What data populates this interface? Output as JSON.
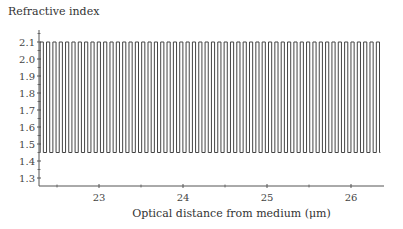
{
  "chart_data": {
    "type": "line",
    "title": "",
    "xlabel": "Optical distance from medium (μm)",
    "ylabel": "Refractive index",
    "xlim": [
      22.28,
      26.38
    ],
    "ylim": [
      1.25,
      2.15
    ],
    "x_ticks": [
      23,
      24,
      25,
      26
    ],
    "x_minor_ticks": [
      22.5,
      23.5,
      24.5,
      25.5
    ],
    "y_ticks": [
      1.3,
      1.4,
      1.5,
      1.6,
      1.7,
      1.8,
      1.9,
      2.0,
      2.1
    ],
    "y_tick_labels": [
      "1.3",
      "1.4",
      "1.5",
      "1.6",
      "1.7",
      "1.8",
      "1.9",
      "2.0",
      "2.1"
    ],
    "grid": false,
    "legend": null,
    "series": [
      {
        "name": "Refractive index profile",
        "shape": "square-wave",
        "high_value": 2.1,
        "low_value": 1.45,
        "x_start": 22.3,
        "x_end": 26.35,
        "period_um": 0.0755,
        "high_fraction": 0.5
      }
    ]
  },
  "labels": {
    "y_title": "Refractive index",
    "x_title": "Optical distance from medium (μm)"
  }
}
